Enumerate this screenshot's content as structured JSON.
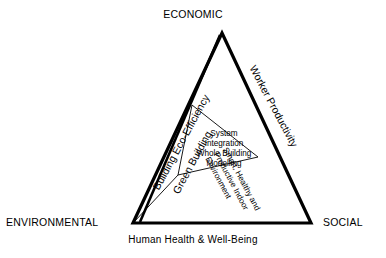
{
  "diagram": {
    "type": "sustainability-triangle",
    "colors": {
      "background": "#ffffff",
      "stroke": "#000000",
      "inner_stroke": "#000000"
    },
    "corners": {
      "top": "ECONOMIC",
      "bottom_left": "ENVIRONMENTAL",
      "bottom_right": "SOCIAL"
    },
    "edges": {
      "left": "Building Eco-Efficiency",
      "right": "Worker Productivity",
      "bottom": "Human Health & Well-Being"
    },
    "sectors": {
      "left_inner": "Green Building",
      "right_inner_line1": "Smart, Healthy and",
      "right_inner_line2": "Productive Indoor",
      "right_inner_line3": "Environment"
    },
    "core": {
      "line1": "System",
      "line2": "Integration",
      "line3": "Whole Building",
      "line4": "Modelling"
    }
  }
}
